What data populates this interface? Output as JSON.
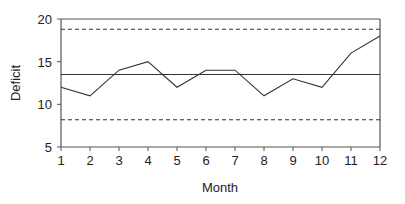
{
  "chart_data": {
    "type": "line",
    "title": "",
    "xlabel": "Month",
    "ylabel": "Deficit",
    "x": [
      1,
      2,
      3,
      4,
      5,
      6,
      7,
      8,
      9,
      10,
      11,
      12
    ],
    "series": [
      {
        "name": "Deficit",
        "values": [
          12,
          11,
          14,
          15,
          12,
          14,
          14,
          11,
          13,
          12,
          16,
          18
        ],
        "style": "solid"
      }
    ],
    "reference_lines": [
      {
        "name": "Mean",
        "value": 13.5,
        "style": "solid"
      },
      {
        "name": "Upper control limit",
        "value": 18.8,
        "style": "dashed"
      },
      {
        "name": "Lower control limit",
        "value": 8.2,
        "style": "dashed"
      }
    ],
    "xlim": [
      1,
      12
    ],
    "ylim": [
      5,
      20
    ],
    "xticks": [
      "1",
      "2",
      "3",
      "4",
      "5",
      "6",
      "7",
      "8",
      "9",
      "10",
      "11",
      "12"
    ],
    "yticks": [
      "5",
      "10",
      "15",
      "20"
    ],
    "grid": false,
    "legend": "none",
    "colors": {
      "line": "#333333",
      "axis": "#555555"
    }
  }
}
